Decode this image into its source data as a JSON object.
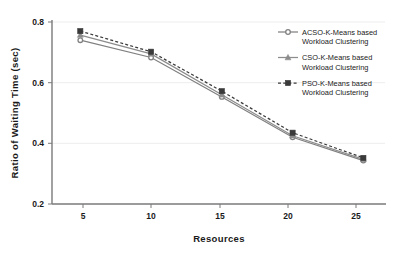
{
  "chart_data": {
    "type": "line",
    "title": "",
    "xlabel": "Resources",
    "ylabel": "Ratio of Waiting Time (sec)",
    "x": [
      5,
      10,
      15,
      20,
      25
    ],
    "xticklabels": [
      "5",
      "10",
      "15",
      "20",
      "25"
    ],
    "yticklabels": [
      "0.2",
      "0.4",
      "0.6",
      "0.8"
    ],
    "yticks": [
      0.2,
      0.4,
      0.6,
      0.8
    ],
    "xlim": [
      3.0,
      26.6
    ],
    "ylim": [
      0.2,
      0.8
    ],
    "grid": "horizontal",
    "legend_position": "top-right",
    "series": [
      {
        "name": "ACSO-K-Means based Workload Clustering",
        "name_line1": "ACSO-K-Means based",
        "name_line2": "Workload Clustering",
        "marker": "circle",
        "linestyle": "solid",
        "color": "#808080",
        "values": [
          0.74,
          0.683,
          0.553,
          0.42,
          0.343
        ]
      },
      {
        "name": "CSO-K-Means based Workload Clustering",
        "name_line1": "CSO-K-Means based",
        "name_line2": "Workload Clustering",
        "marker": "triangle",
        "linestyle": "solid",
        "color": "#8c8c8c",
        "values": [
          0.757,
          0.695,
          0.56,
          0.425,
          0.347
        ]
      },
      {
        "name": "PSO-K-Means based Workload Clustering",
        "name_line1": "PSO-K-Means based",
        "name_line2": "Workload Clustering",
        "marker": "square",
        "linestyle": "dashed",
        "color": "#3a3a3a",
        "values": [
          0.77,
          0.702,
          0.572,
          0.435,
          0.352
        ]
      }
    ]
  },
  "axes": {
    "y_title": "Ratio of Waiting Time (sec)",
    "x_title": "Resources",
    "y_tick_0": "0.2",
    "y_tick_1": "0.4",
    "y_tick_2": "0.6",
    "y_tick_3": "0.8",
    "x_tick_0": "5",
    "x_tick_1": "10",
    "x_tick_2": "15",
    "x_tick_3": "20",
    "x_tick_4": "25"
  },
  "legend": {
    "entries": [
      {
        "line1": "ACSO-K-Means based",
        "line2": "Workload Clustering"
      },
      {
        "line1": "CSO-K-Means based",
        "line2": "Workload Clustering"
      },
      {
        "line1": "PSO-K-Means based",
        "line2": "Workload Clustering"
      }
    ]
  },
  "colors": {
    "axis": "#7a7a7a",
    "grid": "#ededed",
    "text": "#1a1a1a",
    "series_acso": "#808080",
    "series_cso": "#8c8c8c",
    "series_pso": "#3a3a3a"
  }
}
